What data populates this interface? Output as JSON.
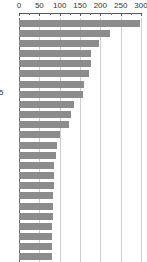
{
  "chart_data": {
    "type": "bar",
    "orientation": "horizontal",
    "title": "",
    "subtitle": "",
    "xlabel": "",
    "ylabel": "5",
    "xlim": [
      0,
      310
    ],
    "ylim": null,
    "grid": true,
    "legend": null,
    "legend_position": "none",
    "bar_color": "#8c8c8c",
    "gridline_color": "#cfcfcf",
    "axis_color": "#555555",
    "background_color": "#ffffff",
    "xticks": [
      0,
      50,
      100,
      150,
      200,
      250,
      300
    ],
    "xtick_labels": [
      "0",
      "50",
      "100",
      "150",
      "200",
      "250",
      "300"
    ],
    "minor_xticks": [
      25,
      75,
      125,
      175,
      225,
      275
    ],
    "categories": [
      "",
      "",
      "",
      "",
      "",
      "",
      "",
      "",
      "",
      "",
      "",
      "",
      "",
      "",
      "",
      "",
      "",
      "",
      "",
      "",
      "",
      "",
      "",
      ""
    ],
    "values": [
      298,
      224,
      196,
      178,
      177,
      172,
      159,
      157,
      136,
      128,
      122,
      102,
      93,
      91,
      87,
      86,
      85,
      84,
      83,
      83,
      82,
      81,
      81,
      80
    ],
    "bar_count": 24,
    "annotations": []
  }
}
